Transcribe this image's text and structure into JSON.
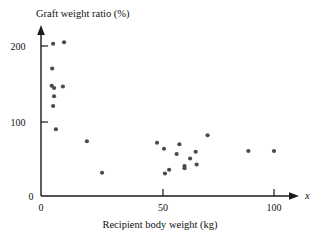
{
  "chart_data": {
    "type": "scatter",
    "title": "",
    "xlabel": "Recipient body weight (kg)",
    "ylabel": "Graft weight ratio (%)",
    "x_axis_variable": "x",
    "xlim": [
      0,
      112
    ],
    "ylim": [
      0,
      215
    ],
    "xticks": [
      0,
      50,
      100
    ],
    "xtick_labels": [
      "0",
      "50",
      "100"
    ],
    "yticks": [
      0,
      100,
      200
    ],
    "ytick_labels": [
      "0",
      "100",
      "200"
    ],
    "grid": false,
    "legend": null,
    "marker": "filled-circle",
    "marker_color": "#4a4a4a",
    "points": [
      {
        "x": 5.2,
        "y": 203
      },
      {
        "x": 9.9,
        "y": 205
      },
      {
        "x": 4.8,
        "y": 170
      },
      {
        "x": 4.6,
        "y": 147
      },
      {
        "x": 5.6,
        "y": 144
      },
      {
        "x": 9.4,
        "y": 146
      },
      {
        "x": 5.6,
        "y": 133
      },
      {
        "x": 5.2,
        "y": 120
      },
      {
        "x": 6.4,
        "y": 89
      },
      {
        "x": 19.7,
        "y": 73
      },
      {
        "x": 26.2,
        "y": 31
      },
      {
        "x": 49.8,
        "y": 71
      },
      {
        "x": 52.8,
        "y": 63
      },
      {
        "x": 53.2,
        "y": 30
      },
      {
        "x": 55.0,
        "y": 35
      },
      {
        "x": 58.2,
        "y": 56
      },
      {
        "x": 59.4,
        "y": 69
      },
      {
        "x": 61.6,
        "y": 40
      },
      {
        "x": 61.6,
        "y": 37
      },
      {
        "x": 64.0,
        "y": 50
      },
      {
        "x": 66.4,
        "y": 59
      },
      {
        "x": 66.8,
        "y": 42
      },
      {
        "x": 71.5,
        "y": 81
      },
      {
        "x": 89.0,
        "y": 60
      },
      {
        "x": 100.0,
        "y": 60
      }
    ]
  },
  "axis_titles": {
    "y_title": "Graft weight ratio (%)",
    "x_title": "Recipient body weight (kg)",
    "x_symbol": "x"
  }
}
